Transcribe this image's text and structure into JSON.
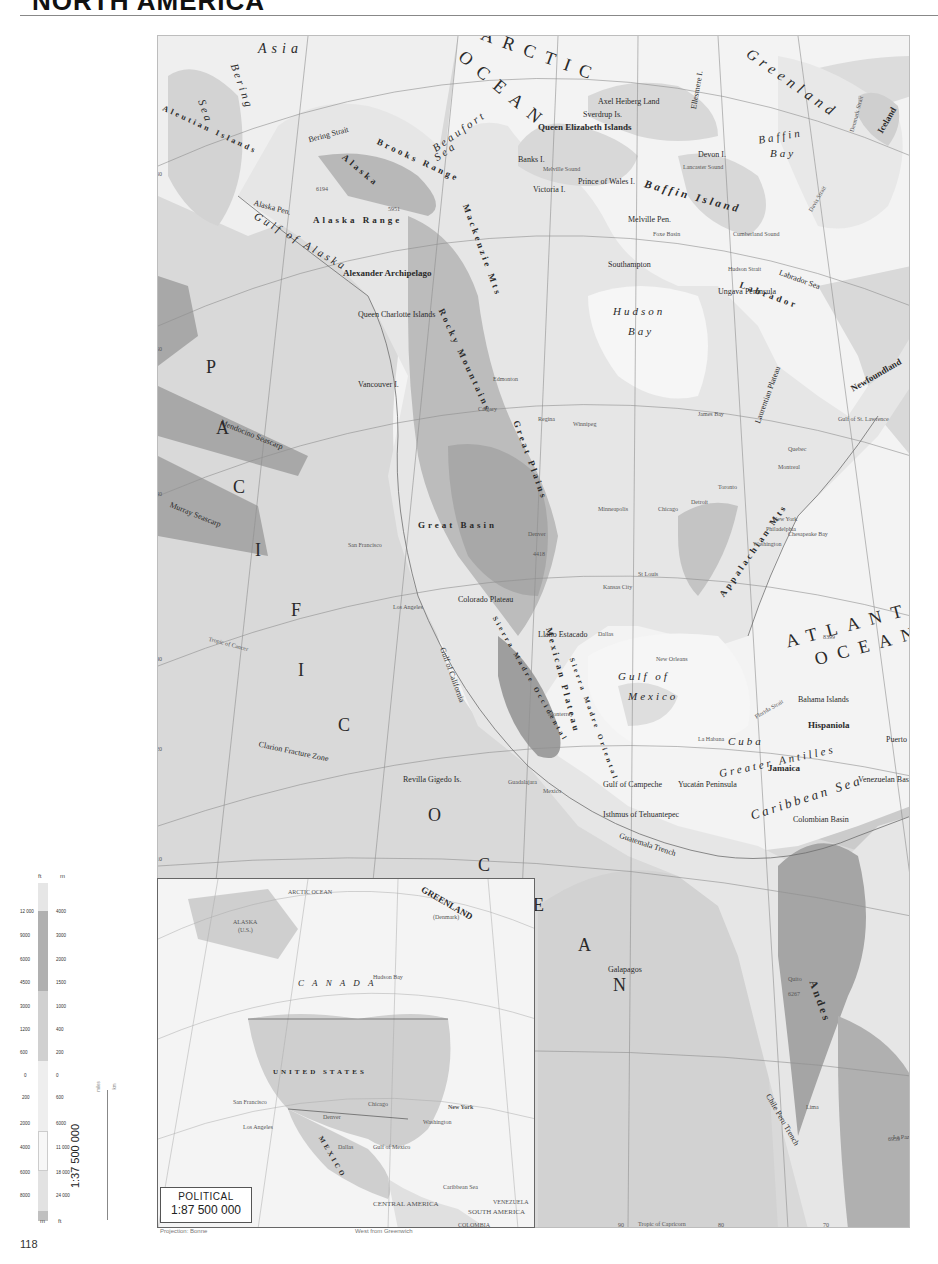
{
  "page": {
    "title": "NORTH AMERICA",
    "page_number": "118",
    "projection_note": "Projection: Bonne",
    "meridian_note": "West from Greenwich"
  },
  "main_map": {
    "oceans": [
      {
        "id": "arctic",
        "text": "ARCTIC"
      },
      {
        "id": "arctic2",
        "text": "OCEAN"
      },
      {
        "id": "pacific_p",
        "text": "P"
      },
      {
        "id": "pacific_a",
        "text": "A"
      },
      {
        "id": "pacific_c",
        "text": "C"
      },
      {
        "id": "pacific_i",
        "text": "I"
      },
      {
        "id": "pacific_f",
        "text": "F"
      },
      {
        "id": "pacific_i2",
        "text": "I"
      },
      {
        "id": "pacific_c2",
        "text": "C"
      },
      {
        "id": "pacific_o",
        "text": "O"
      },
      {
        "id": "pacific_c3",
        "text": "C"
      },
      {
        "id": "pacific_e",
        "text": "E"
      },
      {
        "id": "pacific_a2",
        "text": "A"
      },
      {
        "id": "pacific_n",
        "text": "N"
      },
      {
        "id": "atlantic",
        "text": "ATLANTIC"
      },
      {
        "id": "atlantic2",
        "text": "OCEAN"
      }
    ],
    "seas": [
      {
        "text": "Bering"
      },
      {
        "text": "Sea"
      },
      {
        "text": "Beaufort"
      },
      {
        "text": "Sea"
      },
      {
        "text": "Gulf of Alaska"
      },
      {
        "text": "Hudson"
      },
      {
        "text": "Bay"
      },
      {
        "text": "Baffin"
      },
      {
        "text": "Bay"
      },
      {
        "text": "Gulf of"
      },
      {
        "text": "Mexico"
      },
      {
        "text": "Caribbean Sea"
      },
      {
        "text": "Gulf of California"
      },
      {
        "text": "Gulf of Campeche"
      },
      {
        "text": "Labrador Sea"
      }
    ],
    "regions": [
      {
        "text": "Asia"
      },
      {
        "text": "Greenland"
      },
      {
        "text": "Iceland"
      },
      {
        "text": "Alaska"
      },
      {
        "text": "Queen Elizabeth Islands"
      },
      {
        "text": "Baffin Island"
      },
      {
        "text": "Victoria I."
      },
      {
        "text": "Banks I."
      },
      {
        "text": "Devon I."
      },
      {
        "text": "Ellesmere I."
      },
      {
        "text": "Axel Heiberg Land"
      },
      {
        "text": "Sverdrup Is."
      },
      {
        "text": "Prince of Wales I."
      },
      {
        "text": "Melville Pen."
      },
      {
        "text": "Southampton"
      },
      {
        "text": "Ungava Peninsula"
      },
      {
        "text": "Labrador"
      },
      {
        "text": "Newfoundland"
      },
      {
        "text": "Laurentian Plateau"
      },
      {
        "text": "Alexander Archipelago"
      },
      {
        "text": "Queen Charlotte Islands"
      },
      {
        "text": "Vancouver I."
      },
      {
        "text": "Great Plains"
      },
      {
        "text": "Great Basin"
      },
      {
        "text": "Colorado Plateau"
      },
      {
        "text": "Llano Estacado"
      },
      {
        "text": "Mexican Plateau"
      },
      {
        "text": "Yucatán Peninsula"
      },
      {
        "text": "Isthmus of Tehuantepec"
      },
      {
        "text": "Cuba"
      },
      {
        "text": "Hispaniola"
      },
      {
        "text": "Puerto Rico"
      },
      {
        "text": "Jamaica"
      },
      {
        "text": "Bahama Islands"
      },
      {
        "text": "Greater Antilles"
      },
      {
        "text": "Galapagos"
      },
      {
        "text": "Revilla Gigedo Is."
      },
      {
        "text": "Colombian Basin"
      },
      {
        "text": "Venezuelan Basin"
      }
    ],
    "ranges": [
      {
        "text": "Brooks Range"
      },
      {
        "text": "Alaska Range"
      },
      {
        "text": "Mackenzie Mts"
      },
      {
        "text": "Rocky Mountains"
      },
      {
        "text": "Appalachian Mts"
      },
      {
        "text": "Sierra Madre Occidental"
      },
      {
        "text": "Sierra Madre Oriental"
      },
      {
        "text": "Andes"
      }
    ],
    "features": [
      {
        "text": "Aleutian Islands"
      },
      {
        "text": "Alaska Pen."
      },
      {
        "text": "Bering Strait"
      },
      {
        "text": "Mendocino Seascarp"
      },
      {
        "text": "Murray Seascarp"
      },
      {
        "text": "Clarion Fracture Zone"
      },
      {
        "text": "Guatemala Trench"
      },
      {
        "text": "Chile Peru Trench"
      },
      {
        "text": "Hudson Strait"
      },
      {
        "text": "Davis Strait"
      },
      {
        "text": "Denmark Strait"
      },
      {
        "text": "Lancaster Sound"
      },
      {
        "text": "Melville Sound"
      },
      {
        "text": "Cumberland Sound"
      },
      {
        "text": "Foxe Basin"
      },
      {
        "text": "James Bay"
      },
      {
        "text": "Gulf of St. Lawrence"
      },
      {
        "text": "Chesapeake Bay"
      },
      {
        "text": "Florida Strait"
      },
      {
        "text": "Tropic of Cancer"
      },
      {
        "text": "Tropic of Capricorn"
      }
    ],
    "cities": [
      {
        "text": "San Francisco"
      },
      {
        "text": "Los Angeles"
      },
      {
        "text": "Denver"
      },
      {
        "text": "Chicago"
      },
      {
        "text": "Detroit"
      },
      {
        "text": "Toronto"
      },
      {
        "text": "Montreal"
      },
      {
        "text": "Quebec"
      },
      {
        "text": "New York"
      },
      {
        "text": "Philadelphia"
      },
      {
        "text": "Washington"
      },
      {
        "text": "Minneapolis"
      },
      {
        "text": "St Louis"
      },
      {
        "text": "Kansas City"
      },
      {
        "text": "Dallas"
      },
      {
        "text": "New Orleans"
      },
      {
        "text": "Winnipeg"
      },
      {
        "text": "Regina"
      },
      {
        "text": "Edmonton"
      },
      {
        "text": "Calgary"
      },
      {
        "text": "Monterrey"
      },
      {
        "text": "Mexico"
      },
      {
        "text": "Guadalajara"
      },
      {
        "text": "La Habana"
      },
      {
        "text": "Quito"
      },
      {
        "text": "Lima"
      },
      {
        "text": "La Paz"
      }
    ],
    "elevations": [
      {
        "text": "6194"
      },
      {
        "text": "5951"
      },
      {
        "text": "4418"
      },
      {
        "text": "6959"
      },
      {
        "text": "8399"
      },
      {
        "text": "6267"
      }
    ],
    "graticule": {
      "top_longitudes": [
        "60",
        "70",
        "80",
        "100",
        "120",
        "140",
        "20",
        "10"
      ],
      "bottom_longitudes": [
        "130",
        "120",
        "110",
        "90",
        "80",
        "70"
      ],
      "left_latitudes": [
        "60",
        "50",
        "40",
        "30",
        "20",
        "10",
        "0"
      ],
      "right_latitudes": [
        "70",
        "60",
        "50",
        "40",
        "30",
        "20",
        "10"
      ]
    }
  },
  "inset_map": {
    "title": "POLITICAL",
    "scale": "1:87 500 000",
    "labels": [
      {
        "text": "ARCTIC OCEAN"
      },
      {
        "text": "GREENLAND"
      },
      {
        "text": "(Denmark)"
      },
      {
        "text": "ALASKA"
      },
      {
        "text": "(U.S.)"
      },
      {
        "text": "C A N A D A"
      },
      {
        "text": "Hudson Bay"
      },
      {
        "text": "UNITED STATES"
      },
      {
        "text": "MEXICO"
      },
      {
        "text": "Gulf of Mexico"
      },
      {
        "text": "Caribbean Sea"
      },
      {
        "text": "CENTRAL AMERICA"
      },
      {
        "text": "SOUTH AMERICA"
      },
      {
        "text": "VENEZUELA"
      },
      {
        "text": "COLOMBIA"
      },
      {
        "text": "PACIFIC OCEAN"
      },
      {
        "text": "ATLANTIC OCEAN"
      },
      {
        "text": "Vancouver"
      },
      {
        "text": "Seattle"
      },
      {
        "text": "Winnipeg"
      },
      {
        "text": "Ottawa"
      },
      {
        "text": "Montreal"
      },
      {
        "text": "Toronto"
      },
      {
        "text": "Boston"
      },
      {
        "text": "New York"
      },
      {
        "text": "Philadelphia"
      },
      {
        "text": "Washington"
      },
      {
        "text": "Chicago"
      },
      {
        "text": "Milwaukee"
      },
      {
        "text": "Minneapolis"
      },
      {
        "text": "Detroit"
      },
      {
        "text": "Pittsburgh"
      },
      {
        "text": "Denver"
      },
      {
        "text": "Kansas City"
      },
      {
        "text": "St Louis"
      },
      {
        "text": "Dallas"
      },
      {
        "text": "Houston"
      },
      {
        "text": "New Orleans"
      },
      {
        "text": "San Francisco"
      },
      {
        "text": "Los Angeles"
      },
      {
        "text": "Monterrey"
      },
      {
        "text": "Guadalajara"
      },
      {
        "text": "México"
      },
      {
        "text": "La Habana"
      },
      {
        "text": "Caracas"
      },
      {
        "text": "Tropic of Cancer"
      }
    ]
  },
  "legend": {
    "header_ft": "ft",
    "header_m": "m",
    "land_ticks": [
      {
        "ft": "12 000",
        "m": "4000"
      },
      {
        "ft": "9000",
        "m": "3000"
      },
      {
        "ft": "6000",
        "m": "2000"
      },
      {
        "ft": "4500",
        "m": "1500"
      },
      {
        "ft": "3000",
        "m": "1000"
      },
      {
        "ft": "1200",
        "m": "400"
      },
      {
        "ft": "600",
        "m": "200"
      },
      {
        "ft": "0",
        "m": "0"
      }
    ],
    "sea_ticks": [
      {
        "m": "200",
        "ft": "600"
      },
      {
        "m": "2000",
        "ft": "6000"
      },
      {
        "m": "4000",
        "ft": "11 000"
      },
      {
        "m": "6000",
        "ft": "18 000"
      },
      {
        "m": "8000",
        "ft": "24 000"
      }
    ],
    "footer_m": "m",
    "footer_ft": "ft",
    "colors": {
      "land_high": "#9a9a9a",
      "land_mid": "#b6b6b6",
      "land_low": "#d2d2d2",
      "lowland": "#efefef",
      "sea_shallow": "#f7f7f7",
      "sea_mid": "#dcdcdc",
      "sea_deep": "#a8a8a8",
      "sea_deepest": "#7a7a7a"
    }
  },
  "scale_bar": {
    "ratio": "1:37 500 000",
    "miles_label": "miles",
    "km_label": "km",
    "miles_ticks": [
      "0",
      "100",
      "200",
      "300",
      "400",
      "500",
      "600",
      "700"
    ],
    "km_ticks": [
      "0",
      "100",
      "200",
      "400",
      "600",
      "800",
      "1000",
      "1200"
    ]
  }
}
